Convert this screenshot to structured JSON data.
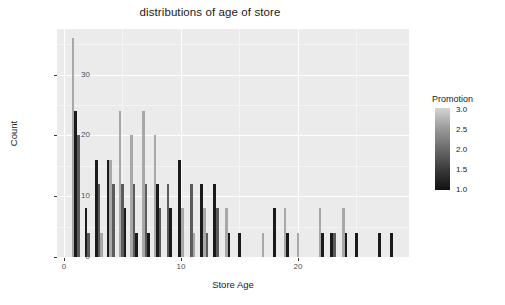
{
  "chart_data": {
    "type": "bar",
    "title": "distributions of age of store",
    "xlabel": "Store Age",
    "ylabel": "Count",
    "xlim": [
      -0.6,
      29.5
    ],
    "ylim": [
      0,
      37.5
    ],
    "xticks": [
      0,
      10,
      20
    ],
    "yticks": [
      0,
      10,
      20,
      30
    ],
    "grid": true,
    "legend": {
      "title": "Promotion",
      "type": "continuous-colorbar",
      "ticks": [
        "3.0",
        "2.5",
        "2.0",
        "1.5",
        "1.0"
      ],
      "tick_values": [
        3.0,
        2.5,
        2.0,
        1.5,
        1.0
      ],
      "position": "right",
      "low_color": "#111111",
      "high_color": "#d4d4d4"
    },
    "series": [
      {
        "name": "Promotion 1",
        "color": "#1a1a1a"
      },
      {
        "name": "Promotion 2",
        "color": "#5c5c5c"
      },
      {
        "name": "Promotion 3",
        "color": "#a8a8a8"
      }
    ],
    "bars": [
      {
        "x": 1,
        "promo": 3,
        "value": 36
      },
      {
        "x": 1,
        "promo": 1,
        "value": 24
      },
      {
        "x": 1,
        "promo": 2,
        "value": 20
      },
      {
        "x": 2,
        "promo": 1,
        "value": 8
      },
      {
        "x": 2,
        "promo": 2,
        "value": 4
      },
      {
        "x": 3,
        "promo": 1,
        "value": 16
      },
      {
        "x": 3,
        "promo": 2,
        "value": 12
      },
      {
        "x": 3,
        "promo": 3,
        "value": 4
      },
      {
        "x": 4,
        "promo": 1,
        "value": 16
      },
      {
        "x": 4,
        "promo": 3,
        "value": 16
      },
      {
        "x": 4,
        "promo": 2,
        "value": 12
      },
      {
        "x": 5,
        "promo": 3,
        "value": 24
      },
      {
        "x": 5,
        "promo": 2,
        "value": 12
      },
      {
        "x": 5,
        "promo": 1,
        "value": 8
      },
      {
        "x": 6,
        "promo": 3,
        "value": 20
      },
      {
        "x": 6,
        "promo": 2,
        "value": 12
      },
      {
        "x": 6,
        "promo": 1,
        "value": 4
      },
      {
        "x": 7,
        "promo": 3,
        "value": 24
      },
      {
        "x": 7,
        "promo": 2,
        "value": 12
      },
      {
        "x": 7,
        "promo": 1,
        "value": 4
      },
      {
        "x": 8,
        "promo": 3,
        "value": 20
      },
      {
        "x": 8,
        "promo": 1,
        "value": 12
      },
      {
        "x": 8,
        "promo": 2,
        "value": 8
      },
      {
        "x": 9,
        "promo": 2,
        "value": 12
      },
      {
        "x": 9,
        "promo": 1,
        "value": 8
      },
      {
        "x": 10,
        "promo": 1,
        "value": 16
      },
      {
        "x": 10,
        "promo": 3,
        "value": 8
      },
      {
        "x": 11,
        "promo": 2,
        "value": 12
      },
      {
        "x": 11,
        "promo": 3,
        "value": 4
      },
      {
        "x": 12,
        "promo": 1,
        "value": 12
      },
      {
        "x": 12,
        "promo": 3,
        "value": 8
      },
      {
        "x": 12,
        "promo": 2,
        "value": 4
      },
      {
        "x": 13,
        "promo": 1,
        "value": 12
      },
      {
        "x": 13,
        "promo": 2,
        "value": 8
      },
      {
        "x": 14,
        "promo": 3,
        "value": 8
      },
      {
        "x": 14,
        "promo": 1,
        "value": 4
      },
      {
        "x": 15,
        "promo": 1,
        "value": 4
      },
      {
        "x": 17,
        "promo": 3,
        "value": 4
      },
      {
        "x": 18,
        "promo": 1,
        "value": 8
      },
      {
        "x": 19,
        "promo": 3,
        "value": 8
      },
      {
        "x": 19,
        "promo": 1,
        "value": 4
      },
      {
        "x": 20,
        "promo": 3,
        "value": 4
      },
      {
        "x": 22,
        "promo": 3,
        "value": 8
      },
      {
        "x": 22,
        "promo": 1,
        "value": 4
      },
      {
        "x": 23,
        "promo": 1,
        "value": 4
      },
      {
        "x": 23,
        "promo": 2,
        "value": 4
      },
      {
        "x": 24,
        "promo": 3,
        "value": 8
      },
      {
        "x": 24,
        "promo": 1,
        "value": 4
      },
      {
        "x": 25,
        "promo": 1,
        "value": 4
      },
      {
        "x": 27,
        "promo": 1,
        "value": 4
      },
      {
        "x": 28,
        "promo": 1,
        "value": 4
      }
    ]
  }
}
